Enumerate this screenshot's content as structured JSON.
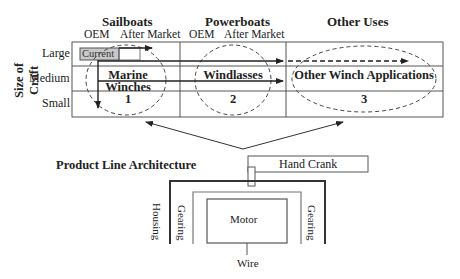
{
  "matrix": {
    "columns": [
      {
        "label": "Sailboats",
        "subcolumns": [
          "OEM",
          "After Market"
        ]
      },
      {
        "label": "Powerboats",
        "subcolumns": [
          "OEM",
          "After Market"
        ]
      },
      {
        "label": "Other Uses",
        "subcolumns": []
      }
    ],
    "y_axis_label": "Size of Craft",
    "rows": [
      "Large",
      "Medium",
      "Small"
    ],
    "current_label": "Current",
    "segments": [
      {
        "name": "Marine Winches",
        "line1": "Marine",
        "line2": "Winches",
        "number": "1"
      },
      {
        "name": "Windlasses",
        "line1": "Windlasses",
        "number": "2"
      },
      {
        "name": "Other Winch Applications",
        "line1": "Other Winch Applications",
        "number": "3"
      }
    ]
  },
  "architecture": {
    "title": "Product Line Architecture",
    "components": {
      "hand_crank": "Hand Crank",
      "housing": "Housing",
      "gearing_left": "Gearing",
      "gearing_right": "Gearing",
      "motor": "Motor",
      "wire": "Wire"
    }
  },
  "colors": {
    "line": "#333333",
    "grid": "#555555",
    "current_fill": "#c8c8c8",
    "dashed": "#444444"
  }
}
